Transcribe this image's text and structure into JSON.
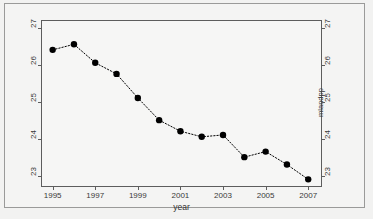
{
  "chart_data": {
    "type": "line",
    "title": "",
    "subtitle": "",
    "xlabel": "year",
    "ylabel": "mlandpp",
    "x": [
      1995,
      1996,
      1997,
      1998,
      1999,
      2000,
      2001,
      2002,
      2003,
      2004,
      2005,
      2006,
      2007
    ],
    "values": [
      26.4,
      26.55,
      26.05,
      25.75,
      25.1,
      24.5,
      24.2,
      24.05,
      24.1,
      23.5,
      23.65,
      23.3,
      22.9
    ],
    "series": [
      {
        "name": "mlandpp",
        "values": [
          26.4,
          26.55,
          26.05,
          25.75,
          25.1,
          24.5,
          24.2,
          24.05,
          24.1,
          23.5,
          23.65,
          23.3,
          22.9
        ],
        "marker": "filled-circle",
        "line_style": "dotted",
        "color": "#000000"
      }
    ],
    "xlim": [
      1994.5,
      2007.6
    ],
    "ylim": [
      22.72,
      27.18
    ],
    "xticks": [
      1995,
      1997,
      1999,
      2001,
      2003,
      2005,
      2007
    ],
    "xtick_labels": [
      "1995",
      "1997",
      "1999",
      "2001",
      "2003",
      "2005",
      "2007"
    ],
    "yticks": [
      23,
      24,
      25,
      26,
      27
    ],
    "ytick_labels": [
      "23",
      "24",
      "25",
      "26",
      "27"
    ],
    "y_axis_right_labels": [
      "23",
      "24",
      "25",
      "26",
      "27"
    ],
    "grid": false,
    "legend": false,
    "legend_position": "none",
    "marker_size": 3.2,
    "line_width": 1
  },
  "figure": {
    "background_color": "#f4f4f3",
    "plot_background_color": "#f6f6f5",
    "frame_color": "#5d5d5d",
    "text_color": "#3a3a3a",
    "border_color": "#9a9a99"
  }
}
